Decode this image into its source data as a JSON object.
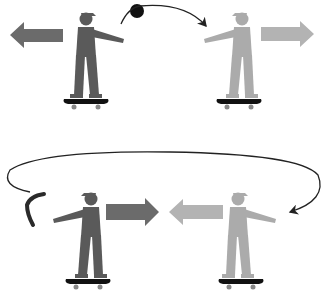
{
  "diagram": {
    "colors": {
      "dark_figure": "#5a5a5a",
      "light_figure": "#ababab",
      "dark_arrow": "#6b6b6b",
      "light_arrow": "#b3b3b3",
      "skateboard": "#111111",
      "trajectory": "#222222",
      "ball": "#111111",
      "boomerang": "#2a2a2a"
    },
    "panels": [
      {
        "id": "top",
        "thrower": {
          "shade": "dark",
          "motion_arrow": "left"
        },
        "catcher": {
          "shade": "light",
          "motion_arrow": "right"
        },
        "projectile": "ball",
        "trajectory": "arc from thrower to catcher"
      },
      {
        "id": "bottom",
        "thrower": {
          "shade": "light",
          "motion_arrow": "left"
        },
        "catcher": {
          "shade": "dark",
          "motion_arrow": "right"
        },
        "projectile": "boomerang",
        "trajectory": "loop from thrower around to the left"
      }
    ]
  }
}
